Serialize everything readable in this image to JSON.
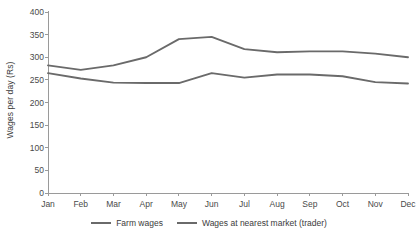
{
  "chart_data": {
    "type": "line",
    "title": "",
    "xlabel": "",
    "ylabel": "Wages per day (Rs)",
    "categories": [
      "Jan",
      "Feb",
      "Mar",
      "Apr",
      "May",
      "Jun",
      "Jul",
      "Aug",
      "Sep",
      "Oct",
      "Nov",
      "Dec"
    ],
    "series": [
      {
        "name": "Farm wages",
        "color": "#6a6a6a",
        "values": [
          265,
          253,
          244,
          243,
          243,
          265,
          255,
          262,
          262,
          258,
          245,
          242
        ]
      },
      {
        "name": "Wages at nearest market (trader)",
        "color": "#6a6a6a",
        "values": [
          282,
          272,
          282,
          300,
          340,
          345,
          318,
          311,
          313,
          313,
          308,
          300
        ]
      }
    ],
    "ylim": [
      0,
      400
    ],
    "yticks": [
      0,
      50,
      100,
      150,
      200,
      250,
      300,
      350,
      400
    ],
    "ytick_labels": [
      "0",
      "50",
      "100",
      "150",
      "200",
      "250",
      "300",
      "350",
      "400"
    ],
    "grid": false,
    "legend_position": "bottom-center",
    "axis_color": "#9a9a9a",
    "text_color": "#4a4a4a"
  },
  "legend": {
    "items": [
      {
        "label": "Farm wages"
      },
      {
        "label": "Wages at nearest market (trader)"
      }
    ]
  }
}
